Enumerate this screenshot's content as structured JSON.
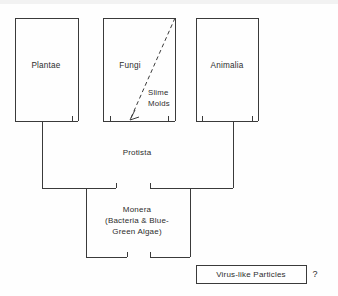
{
  "diagram": {
    "kingdoms": [
      {
        "id": "plantae",
        "label": "Plantae"
      },
      {
        "id": "fungi",
        "label": "Fungi"
      },
      {
        "id": "animalia",
        "label": "Animalia"
      }
    ],
    "annotations": [
      {
        "id": "slime-molds",
        "line1": "Slime",
        "line2": "Molds"
      }
    ],
    "protista": {
      "label": "Protista"
    },
    "monera": {
      "line1": "Monera",
      "line2": "(Bacteria & Blue-",
      "line3": "Green Algae)"
    },
    "virus_box": {
      "label": "Virus-like Particles"
    },
    "question_mark": "?",
    "colors": {
      "line": "#3a3a3a",
      "text": "#2d2d2d",
      "background": "#fefefe"
    }
  }
}
